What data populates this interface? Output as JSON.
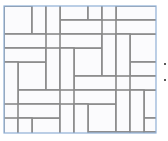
{
  "diagram": {
    "type": "tile-pattern",
    "colors": {
      "tile_fill": "#fbfbfd",
      "grout": "#8a8a8a",
      "border": "#8fb0d6",
      "marker": "#222222"
    },
    "frame": {
      "x": 4,
      "y": 6,
      "width": 152,
      "height": 127
    },
    "unit": 14,
    "markers": [
      {
        "x": 164,
        "y": 63
      },
      {
        "x": 164,
        "y": 79
      }
    ]
  }
}
